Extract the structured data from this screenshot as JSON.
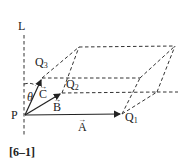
{
  "figure": {
    "caption": "[6–1]",
    "labels": {
      "line": "L",
      "origin": "P",
      "angle": "θ",
      "q1": "Q",
      "q1_sub": "1",
      "q2": "Q",
      "q2_sub": "2",
      "q3": "Q",
      "q3_sub": "3",
      "vec_a": "A",
      "vec_b": "B",
      "vec_c": "C",
      "vec_arrow": "→"
    }
  }
}
